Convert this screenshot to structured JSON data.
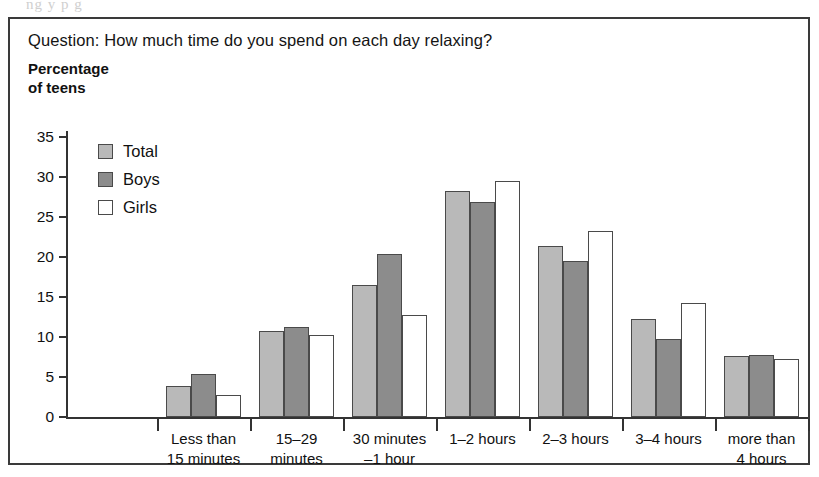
{
  "bleed_text": "ng    y          p           g",
  "figure": {
    "question": "Question: How much time do you spend on each day relaxing?",
    "axis_title_line1": "Percentage",
    "axis_title_line2": "of teens"
  },
  "legend": {
    "items": [
      {
        "label": "Total",
        "color": "#b9b9b9",
        "swatch": "total"
      },
      {
        "label": "Boys",
        "color": "#8c8c8c",
        "swatch": "boys"
      },
      {
        "label": "Girls",
        "color": "#ffffff",
        "swatch": "girls"
      }
    ]
  },
  "yaxis": {
    "ticks": [
      "0",
      "5",
      "10",
      "15",
      "20",
      "25",
      "30",
      "35"
    ]
  },
  "chart_data": {
    "type": "bar",
    "title": "Question: How much time do you spend on each day relaxing?",
    "xlabel": "",
    "ylabel": "Percentage of teens",
    "ylim": [
      0,
      35
    ],
    "ytick_step": 5,
    "grid": false,
    "legend_position": "inside-top-left",
    "categories": [
      "Less than 15 minutes",
      "15–29 minutes",
      "30 minutes –1 hour",
      "1–2 hours",
      "2–3 hours",
      "3–4 hours",
      "more than 4 hours"
    ],
    "category_lines": [
      [
        "Less than",
        "15 minutes"
      ],
      [
        "15–29",
        "minutes"
      ],
      [
        "30 minutes",
        "–1 hour"
      ],
      [
        "1–2 hours",
        ""
      ],
      [
        "2–3 hours",
        ""
      ],
      [
        "3–4 hours",
        ""
      ],
      [
        "more than",
        "4 hours"
      ]
    ],
    "series": [
      {
        "name": "Total",
        "color": "#b9b9b9",
        "values": [
          3.9,
          10.8,
          16.5,
          28.3,
          21.4,
          12.2,
          7.6
        ]
      },
      {
        "name": "Boys",
        "color": "#8c8c8c",
        "values": [
          5.4,
          11.2,
          20.4,
          26.9,
          19.5,
          9.7,
          7.8
        ]
      },
      {
        "name": "Girls",
        "color": "#ffffff",
        "values": [
          2.8,
          10.3,
          12.7,
          29.5,
          23.3,
          14.3,
          7.3
        ]
      }
    ]
  }
}
